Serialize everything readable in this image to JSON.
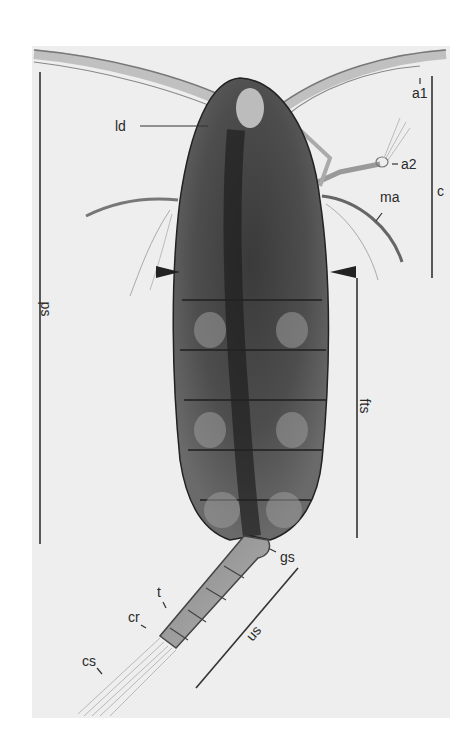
{
  "figure": {
    "colors": {
      "background": "#ffffff",
      "photo": "#eeeeee",
      "body_dark": "#2b2b2b",
      "body_mid": "#5a5a5a",
      "line": "#333333"
    },
    "labels": {
      "a1": "a1",
      "a2": "a2",
      "ld": "ld",
      "ma": "ma",
      "c": "c",
      "ps": "ps",
      "fts": "fts",
      "gs": "gs",
      "t": "t",
      "cr": "cr",
      "cs": "cs",
      "us": "us"
    }
  }
}
